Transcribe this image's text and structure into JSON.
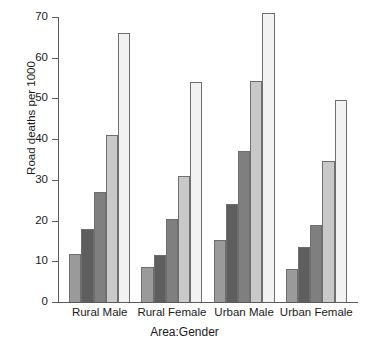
{
  "chart_data": {
    "type": "bar",
    "title": "",
    "subtitle": "",
    "xlabel": "Area:Gender",
    "ylabel": "Road deaths per 1000",
    "categories": [
      "Rural Male",
      "Rural Female",
      "Urban Male",
      "Urban Female"
    ],
    "series": [
      {
        "name": "series-1",
        "color": "#9a9a9a",
        "values": [
          11.7,
          8.6,
          15.2,
          8.0
        ]
      },
      {
        "name": "series-2",
        "color": "#5e5e5e",
        "values": [
          18.0,
          11.5,
          24.0,
          13.5
        ]
      },
      {
        "name": "series-3",
        "color": "#7f7f7f",
        "values": [
          27.0,
          20.3,
          37.0,
          19.0
        ]
      },
      {
        "name": "series-4",
        "color": "#c9c9c9",
        "values": [
          41.0,
          31.0,
          54.3,
          34.7
        ]
      },
      {
        "name": "series-5",
        "color": "#f2f2f2",
        "values": [
          66.0,
          54.0,
          71.0,
          49.6
        ]
      }
    ],
    "ylim": [
      0,
      70
    ],
    "yticks": [
      0,
      10,
      20,
      30,
      40,
      50,
      60,
      70
    ],
    "ytick_labels": [
      "0",
      "10",
      "20",
      "30",
      "40",
      "50",
      "60",
      "70"
    ],
    "grid": false,
    "legend": "none",
    "axis_color": "#5a5a5a",
    "bar_border_color": "#6e6e6e",
    "background": "#ffffff"
  }
}
